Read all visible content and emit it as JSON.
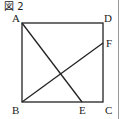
{
  "figure": {
    "title": "図 2",
    "labels": {
      "A": "A",
      "B": "B",
      "C": "C",
      "D": "D",
      "E": "E",
      "F": "F"
    },
    "points": {
      "A": [
        22,
        23
      ],
      "B": [
        22,
        102
      ],
      "C": [
        103,
        102
      ],
      "D": [
        103,
        23
      ],
      "E": [
        82,
        102
      ],
      "F": [
        103,
        43
      ]
    },
    "segments": [
      [
        "A",
        "D"
      ],
      [
        "D",
        "C"
      ],
      [
        "C",
        "B"
      ],
      [
        "B",
        "A"
      ],
      [
        "A",
        "E"
      ],
      [
        "B",
        "F"
      ]
    ],
    "line_color": "#222222"
  }
}
